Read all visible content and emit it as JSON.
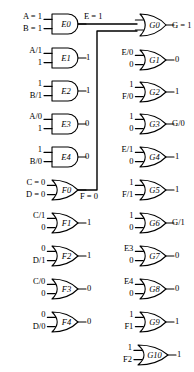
{
  "figure": {
    "kind": "logic-circuit-fault-diagram",
    "stroke_color": "#000000",
    "background": "#ffffff"
  },
  "gates": [
    {
      "id": "E0",
      "name": "E0",
      "type": "AND",
      "x": 52,
      "y": 14,
      "w": 26,
      "h": 20,
      "inputs": [
        {
          "label": "A = 1",
          "tx": 4,
          "ty": 12
        },
        {
          "label": "B = 1",
          "tx": 4,
          "ty": 24
        }
      ],
      "output": {
        "label": "E = 1",
        "tx": 84,
        "ty": 12
      }
    },
    {
      "id": "E1",
      "name": "E1",
      "type": "AND",
      "x": 52,
      "y": 48,
      "w": 26,
      "h": 20,
      "inputs": [
        {
          "label": "A/1",
          "tx": 20,
          "ty": 46
        },
        {
          "label": "1",
          "tx": 36,
          "ty": 58
        }
      ],
      "output": {
        "label": "1",
        "tx": 86,
        "ty": 53
      }
    },
    {
      "id": "E2",
      "name": "E2",
      "type": "AND",
      "x": 52,
      "y": 81,
      "w": 26,
      "h": 20,
      "inputs": [
        {
          "label": "1",
          "tx": 36,
          "ty": 79
        },
        {
          "label": "B/1",
          "tx": 20,
          "ty": 91
        }
      ],
      "output": {
        "label": "1",
        "tx": 86,
        "ty": 86
      }
    },
    {
      "id": "E3",
      "name": "E3",
      "type": "AND",
      "x": 52,
      "y": 114,
      "w": 26,
      "h": 20,
      "inputs": [
        {
          "label": "A/0",
          "tx": 20,
          "ty": 112
        },
        {
          "label": "1",
          "tx": 36,
          "ty": 124
        }
      ],
      "output": {
        "label": "0",
        "tx": 85,
        "ty": 119
      }
    },
    {
      "id": "E4",
      "name": "E4",
      "type": "AND",
      "x": 52,
      "y": 147,
      "w": 26,
      "h": 20,
      "inputs": [
        {
          "label": "1",
          "tx": 36,
          "ty": 145
        },
        {
          "label": "B/0",
          "tx": 20,
          "ty": 157
        }
      ],
      "output": {
        "label": "0",
        "tx": 85,
        "ty": 152
      }
    },
    {
      "id": "F0",
      "name": "F0",
      "type": "OR",
      "x": 52,
      "y": 180,
      "w": 26,
      "h": 20,
      "inputs": [
        {
          "label": "C = 0",
          "tx": 4,
          "ty": 178
        },
        {
          "label": "D = 0",
          "tx": 4,
          "ty": 190
        }
      ],
      "output": {
        "label": "F = 0",
        "tx": 80,
        "ty": 192
      }
    },
    {
      "id": "F1",
      "name": "F1",
      "type": "OR",
      "x": 52,
      "y": 213,
      "w": 26,
      "h": 20,
      "inputs": [
        {
          "label": "C/1",
          "tx": 20,
          "ty": 211
        },
        {
          "label": "0",
          "tx": 36,
          "ty": 223
        }
      ],
      "output": {
        "label": "1",
        "tx": 87,
        "ty": 218
      }
    },
    {
      "id": "F2",
      "name": "F2",
      "type": "OR",
      "x": 52,
      "y": 246,
      "w": 26,
      "h": 20,
      "inputs": [
        {
          "label": "0",
          "tx": 36,
          "ty": 244
        },
        {
          "label": "D/1",
          "tx": 20,
          "ty": 256
        }
      ],
      "output": {
        "label": "1",
        "tx": 87,
        "ty": 251
      }
    },
    {
      "id": "F3",
      "name": "F3",
      "type": "OR",
      "x": 52,
      "y": 279,
      "w": 26,
      "h": 20,
      "inputs": [
        {
          "label": "C/0",
          "tx": 20,
          "ty": 277
        },
        {
          "label": "0",
          "tx": 36,
          "ty": 289
        }
      ],
      "output": {
        "label": "0",
        "tx": 87,
        "ty": 284
      }
    },
    {
      "id": "F4",
      "name": "F4",
      "type": "OR",
      "x": 52,
      "y": 312,
      "w": 26,
      "h": 20,
      "inputs": [
        {
          "label": "0",
          "tx": 36,
          "ty": 310
        },
        {
          "label": "D/0",
          "tx": 20,
          "ty": 322
        }
      ],
      "output": {
        "label": "0",
        "tx": 87,
        "ty": 317
      }
    },
    {
      "id": "G0",
      "name": "G0",
      "type": "OR",
      "x": 140,
      "y": 14,
      "w": 26,
      "h": 22,
      "inputs": [],
      "output": {
        "label": "G = 1",
        "tx": 172,
        "ty": 21
      }
    },
    {
      "id": "G1",
      "name": "G1",
      "type": "OR",
      "x": 140,
      "y": 50,
      "w": 26,
      "h": 20,
      "inputs": [
        {
          "label": "E/0",
          "tx": 107,
          "ty": 48
        },
        {
          "label": "0",
          "tx": 124,
          "ty": 60
        }
      ],
      "output": {
        "label": "0",
        "tx": 175,
        "ty": 55
      }
    },
    {
      "id": "G2",
      "name": "G2",
      "type": "OR",
      "x": 140,
      "y": 82,
      "w": 26,
      "h": 20,
      "inputs": [
        {
          "label": "1",
          "tx": 124,
          "ty": 80
        },
        {
          "label": "F/0",
          "tx": 107,
          "ty": 92
        }
      ],
      "output": {
        "label": "1",
        "tx": 175,
        "ty": 87
      }
    },
    {
      "id": "G3",
      "name": "G3",
      "type": "OR",
      "x": 140,
      "y": 114,
      "w": 26,
      "h": 20,
      "inputs": [
        {
          "label": "1",
          "tx": 124,
          "ty": 112
        },
        {
          "label": "0",
          "tx": 124,
          "ty": 124
        }
      ],
      "output": {
        "label": "G/0",
        "tx": 172,
        "ty": 119
      }
    },
    {
      "id": "G4",
      "name": "G4",
      "type": "OR",
      "x": 140,
      "y": 147,
      "w": 26,
      "h": 20,
      "inputs": [
        {
          "label": "E/1",
          "tx": 107,
          "ty": 145
        },
        {
          "label": "0",
          "tx": 124,
          "ty": 157
        }
      ],
      "output": {
        "label": "1",
        "tx": 175,
        "ty": 152
      }
    },
    {
      "id": "G5",
      "name": "G5",
      "type": "OR",
      "x": 140,
      "y": 180,
      "w": 26,
      "h": 20,
      "inputs": [
        {
          "label": "1",
          "tx": 124,
          "ty": 178
        },
        {
          "label": "F/1",
          "tx": 107,
          "ty": 190
        }
      ],
      "output": {
        "label": "1",
        "tx": 175,
        "ty": 185
      }
    },
    {
      "id": "G6",
      "name": "G6",
      "type": "OR",
      "x": 140,
      "y": 213,
      "w": 26,
      "h": 20,
      "inputs": [
        {
          "label": "1",
          "tx": 124,
          "ty": 211
        },
        {
          "label": "0",
          "tx": 124,
          "ty": 223
        }
      ],
      "output": {
        "label": "G/1",
        "tx": 172,
        "ty": 218
      }
    },
    {
      "id": "G7",
      "name": "G7",
      "type": "OR",
      "x": 140,
      "y": 246,
      "w": 26,
      "h": 20,
      "inputs": [
        {
          "label": "E3",
          "tx": 108,
          "ty": 244
        },
        {
          "label": "0",
          "tx": 124,
          "ty": 256
        }
      ],
      "output": {
        "label": "0",
        "tx": 175,
        "ty": 251
      }
    },
    {
      "id": "G8",
      "name": "G8",
      "type": "OR",
      "x": 140,
      "y": 279,
      "w": 26,
      "h": 20,
      "inputs": [
        {
          "label": "E4",
          "tx": 108,
          "ty": 277
        },
        {
          "label": "0",
          "tx": 124,
          "ty": 289
        }
      ],
      "output": {
        "label": "0",
        "tx": 175,
        "ty": 284
      }
    },
    {
      "id": "G9",
      "name": "G9",
      "type": "OR",
      "x": 140,
      "y": 312,
      "w": 26,
      "h": 20,
      "inputs": [
        {
          "label": "1",
          "tx": 124,
          "ty": 310
        },
        {
          "label": "F1",
          "tx": 108,
          "ty": 322
        }
      ],
      "output": {
        "label": "1",
        "tx": 175,
        "ty": 317
      }
    },
    {
      "id": "G10",
      "name": "G10",
      "type": "OR",
      "x": 138,
      "y": 345,
      "w": 30,
      "h": 20,
      "inputs": [
        {
          "label": "1",
          "tx": 124,
          "ty": 343
        },
        {
          "label": "F2",
          "tx": 108,
          "ty": 355
        }
      ],
      "output": {
        "label": "1",
        "tx": 177,
        "ty": 350
      }
    }
  ],
  "wires": {
    "e0_to_g0": "E output routed right to G0 upper input",
    "f0_to_g0": "F output routed up and right to G0 lower input"
  }
}
